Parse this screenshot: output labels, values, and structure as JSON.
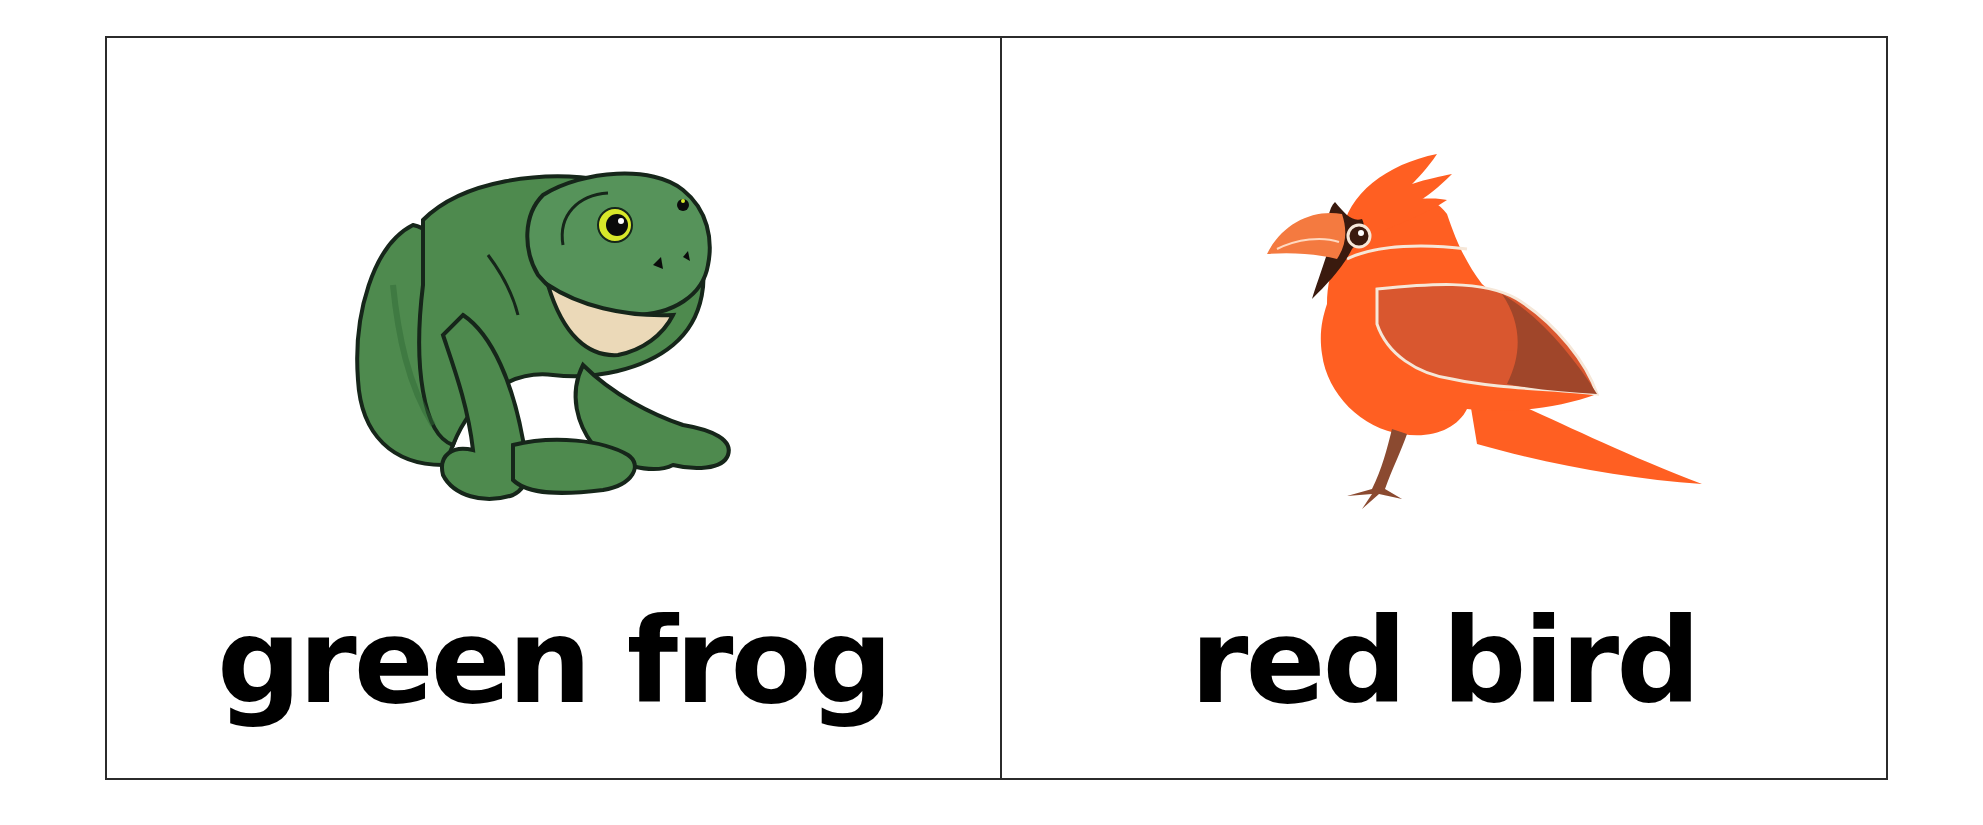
{
  "cards": [
    {
      "label": "green frog",
      "illustration": "frog-illustration",
      "colors": {
        "primary": "#4E8A4E",
        "shadow": "#2F6A35",
        "outline": "#16261a",
        "throat": "#EBD9B8",
        "eye_ring": "#D8E82A"
      }
    },
    {
      "label": "red bird",
      "illustration": "cardinal-illustration",
      "colors": {
        "primary": "#FF5F22",
        "beak": "#F47A40",
        "mask": "#3A1A0E",
        "wing": "#D9572F",
        "wing_tip": "#A0462A",
        "legs": "#8B4A30"
      }
    }
  ],
  "frame": {
    "border_color": "#2b2b2b",
    "background": "#ffffff"
  }
}
